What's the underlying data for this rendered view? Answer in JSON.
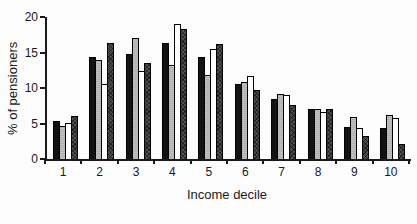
{
  "figure": {
    "background": "#fcfcfc",
    "axis_color": "#1a1a1a"
  },
  "chart_data": {
    "type": "bar",
    "title": "",
    "xlabel": "Income decile",
    "ylabel": "% of pensioners",
    "categories": [
      "1",
      "2",
      "3",
      "4",
      "5",
      "6",
      "7",
      "8",
      "9",
      "10"
    ],
    "series": [
      {
        "name": "black",
        "fill": "#121212",
        "values": [
          5.3,
          14.4,
          14.8,
          16.3,
          14.3,
          10.5,
          8.5,
          7.0,
          4.5,
          4.4
        ]
      },
      {
        "name": "gray",
        "fill": "#b0b0b0",
        "values": [
          4.6,
          14.0,
          17.0,
          13.3,
          11.8,
          10.9,
          9.2,
          7.1,
          5.9,
          6.2
        ]
      },
      {
        "name": "white",
        "fill": "#ffffff",
        "values": [
          5.1,
          10.5,
          12.4,
          19.0,
          15.5,
          11.7,
          9.0,
          6.6,
          4.4,
          5.8
        ]
      },
      {
        "name": "dark-hatched",
        "fill": "#4f4f4f",
        "values": [
          6.1,
          16.3,
          13.5,
          18.3,
          16.2,
          9.7,
          7.6,
          7.0,
          3.2,
          2.1
        ]
      }
    ],
    "ylim": [
      0,
      20
    ],
    "yticks": [
      0,
      5,
      10,
      15,
      20
    ],
    "grid": false,
    "legend": "none"
  }
}
